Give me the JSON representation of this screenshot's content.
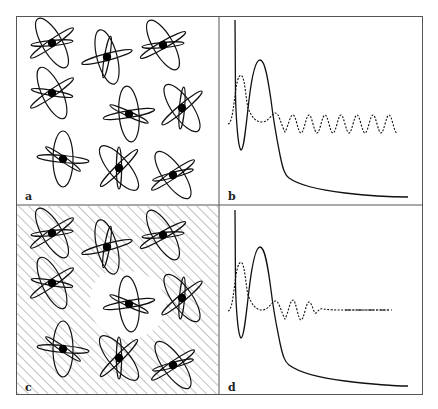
{
  "figure": {
    "frame_color": "#555555",
    "line_color": "#111111",
    "panels": [
      {
        "id": "a",
        "label": "a",
        "type": "molecule-array",
        "hatched": false,
        "description": "Array of molecules, each a black nucleus with three crossed elliptical orbitals"
      },
      {
        "id": "b",
        "label": "b",
        "type": "spectrum-plot",
        "oscillation": "sustained",
        "description": "Solid curve: sharp spike, dip, broad peak, long decay; dotted curve: persistent oscillation"
      },
      {
        "id": "c",
        "label": "c",
        "type": "molecule-array",
        "hatched": true,
        "description": "Same molecule array embedded in hatched medium with a clear region around central molecule"
      },
      {
        "id": "d",
        "label": "d",
        "type": "spectrum-plot",
        "oscillation": "damped",
        "description": "Solid curve as in b; dotted curve oscillation damps to a flat dash-dot line"
      }
    ],
    "molecules": [
      {
        "cx": 52,
        "cy": 43,
        "angles": [
          -35,
          60,
          -5
        ]
      },
      {
        "cx": 107,
        "cy": 57,
        "angles": [
          -15,
          75,
          100
        ]
      },
      {
        "cx": 163,
        "cy": 45,
        "angles": [
          -30,
          60,
          -5
        ]
      },
      {
        "cx": 52,
        "cy": 93,
        "angles": [
          -35,
          65,
          10
        ]
      },
      {
        "cx": 129,
        "cy": 114,
        "angles": [
          -10,
          85,
          25
        ]
      },
      {
        "cx": 182,
        "cy": 108,
        "angles": [
          -40,
          55,
          95
        ]
      },
      {
        "cx": 63,
        "cy": 159,
        "angles": [
          5,
          90,
          35
        ]
      },
      {
        "cx": 119,
        "cy": 168,
        "angles": [
          -45,
          50,
          90
        ]
      },
      {
        "cx": 173,
        "cy": 175,
        "angles": [
          -35,
          55,
          -15
        ]
      }
    ]
  }
}
